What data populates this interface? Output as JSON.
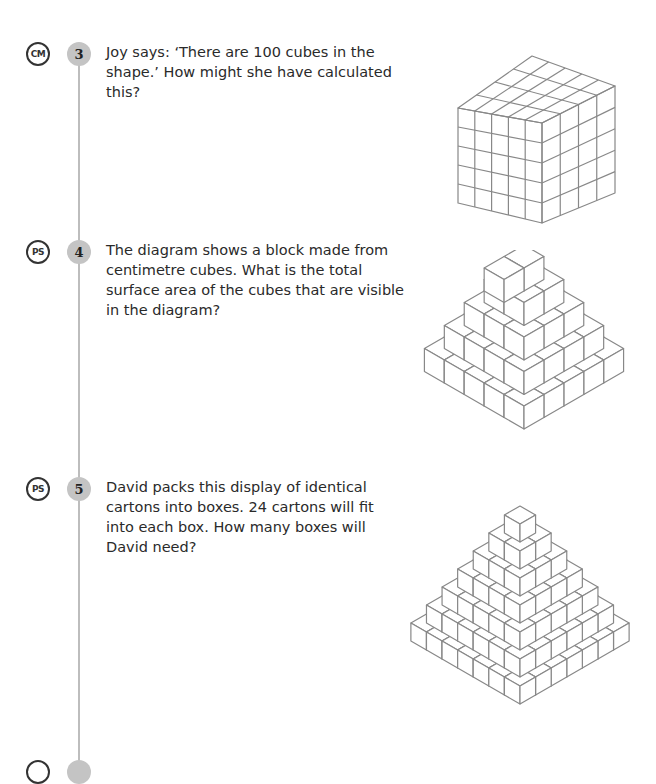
{
  "questions": [
    {
      "strand": "CM",
      "number": "3",
      "text": "Joy says: ‘There are 100 cubes in the shape.’ How might she have calculated this?",
      "figure": {
        "type": "cuboid",
        "length": 5,
        "width": 4,
        "height": 5
      }
    },
    {
      "strand": "PS",
      "number": "4",
      "text": "The diagram shows a block made from centimetre cubes. What is the total surface area of the cubes that are visible in the diagram?",
      "figure": {
        "type": "stepped-pyramid",
        "layers": 5,
        "top": "1x2"
      }
    },
    {
      "strand": "PS",
      "number": "5",
      "text": "David packs this display of identical cartons into boxes. 24 cartons will fit into each box. How many boxes will David need?",
      "figure": {
        "type": "stepped-pyramid",
        "layers": 7,
        "top": "1x1"
      }
    }
  ],
  "colors": {
    "badge_fill": "#c4c4c4",
    "line": "#bdbdbd",
    "figure_stroke": "#888888"
  }
}
